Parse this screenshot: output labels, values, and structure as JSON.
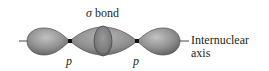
{
  "figure": {
    "title": {
      "symbol": "σ",
      "text": "bond"
    },
    "orbital_labels": [
      "p",
      "p"
    ],
    "axis_label": {
      "line1": "Internuclear",
      "line2": "axis"
    },
    "colors": {
      "lobe_fill": "#8c8c8c",
      "lobe_highlight": "#b8b8b8",
      "lobe_edge": "#5a5a5a",
      "node": "#111111",
      "axis_line": "#444444",
      "text": "#231f20"
    }
  }
}
